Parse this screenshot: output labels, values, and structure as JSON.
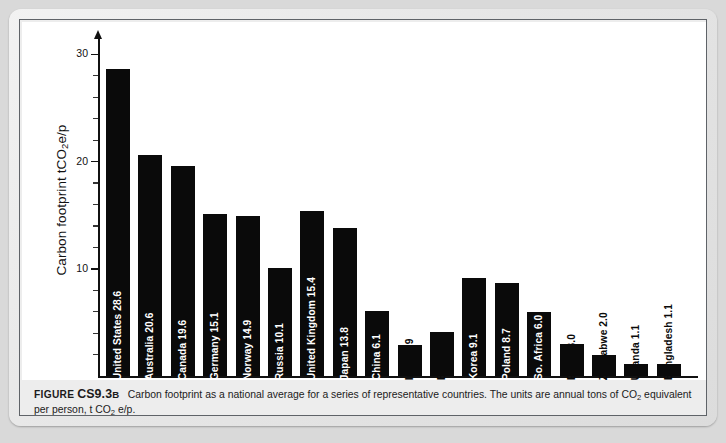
{
  "figure": {
    "label_word": "FIGURE",
    "number": "CS9.3",
    "letter": "B",
    "caption_part1": "Carbon footprint as a national average for a series of representative countries. The units are annual tons of CO",
    "caption_sub1": "2",
    "caption_part2": " equivalent per person, t CO",
    "caption_sub2": "2",
    "caption_part3": " e/p."
  },
  "chart_data": {
    "type": "bar",
    "title": "",
    "xlabel": "",
    "ylabel": "Carbon footprint  tCO2e/p",
    "ylabel_prefix": "Carbon footprint  tCO",
    "ylabel_sub": "2",
    "ylabel_suffix": "e/p",
    "ylim": [
      0,
      31
    ],
    "grid": false,
    "legend": "none",
    "y_major_ticks": [
      10,
      20,
      30
    ],
    "y_major_tick_labels": [
      "10",
      "20",
      "30"
    ],
    "y_minor_tick_interval": 2,
    "bar_color": "#0a0a0a",
    "categories": [
      "United States",
      "Australia",
      "Canada",
      "Germany",
      "Norway",
      "Russia",
      "United Kingdom",
      "Japan",
      "China",
      "India",
      "Brazil",
      "Korea",
      "Poland",
      "So. Africa",
      "Egypt",
      "Zimbabwe",
      "Uganda",
      "Bangladesh"
    ],
    "values": [
      28.6,
      20.6,
      19.6,
      15.1,
      14.9,
      10.1,
      15.4,
      13.8,
      6.1,
      2.9,
      4.1,
      9.1,
      8.7,
      6.0,
      3.0,
      2.0,
      1.1,
      1.1
    ],
    "bars": [
      {
        "country": "United States",
        "value": 28.6,
        "label": "United States  28.6",
        "label_style": "inside"
      },
      {
        "country": "Australia",
        "value": 20.6,
        "label": "Australia  20.6",
        "label_style": "inside"
      },
      {
        "country": "Canada",
        "value": 19.6,
        "label": "Canada  19.6",
        "label_style": "inside"
      },
      {
        "country": "Germany",
        "value": 15.1,
        "label": "Germany  15.1",
        "label_style": "inside"
      },
      {
        "country": "Norway",
        "value": 14.9,
        "label": "Norway  14.9",
        "label_style": "inside"
      },
      {
        "country": "Russia",
        "value": 10.1,
        "label": "Russia  10.1",
        "label_style": "inside"
      },
      {
        "country": "United Kingdom",
        "value": 15.4,
        "label": "United Kingdom  15.4",
        "label_style": "inside"
      },
      {
        "country": "Japan",
        "value": 13.8,
        "label": "Japan  13.8",
        "label_style": "inside"
      },
      {
        "country": "China",
        "value": 6.1,
        "label": "China  6.1",
        "label_style": "inside"
      },
      {
        "country": "India",
        "value": 2.9,
        "label": "India  2.9",
        "label_style": "outside"
      },
      {
        "country": "Brazil",
        "value": 4.1,
        "label": "Brazil  4.1",
        "label_style": "outside"
      },
      {
        "country": "Korea",
        "value": 9.1,
        "label": "Korea  9.1",
        "label_style": "inside"
      },
      {
        "country": "Poland",
        "value": 8.7,
        "label": "Poland  8.7",
        "label_style": "inside"
      },
      {
        "country": "So. Africa",
        "value": 6.0,
        "label": "So. Africa  6.0",
        "label_style": "inside"
      },
      {
        "country": "Egypt",
        "value": 3.0,
        "label": "Egypt  3.0",
        "label_style": "outside"
      },
      {
        "country": "Zimbabwe",
        "value": 2.0,
        "label": "Zimbabwe  2.0",
        "label_style": "outside"
      },
      {
        "country": "Uganda",
        "value": 1.1,
        "label": "Uganda  1.1",
        "label_style": "outside"
      },
      {
        "country": "Bangladesh",
        "value": 1.1,
        "label": "Bangladesh  1.1",
        "label_style": "outside"
      }
    ]
  }
}
